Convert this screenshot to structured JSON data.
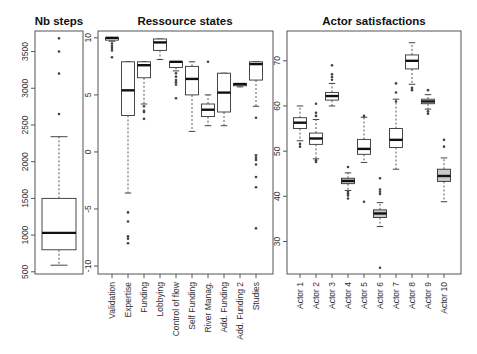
{
  "chart_data": [
    {
      "type": "box",
      "title": "Nb steps",
      "xlabel": "",
      "ylabel": "",
      "categories": [
        ""
      ],
      "yticks": [
        500,
        1000,
        1500,
        2000,
        2500,
        3000,
        3500
      ],
      "ylim": [
        470,
        3780
      ],
      "grid": false,
      "series": [
        {
          "name": "Nb steps",
          "whisker_low": 590,
          "q1": 800,
          "median": 1030,
          "q3": 1500,
          "whisker_high": 2340,
          "outliers": [
            2650,
            3200,
            3500,
            3680
          ],
          "fill": "#ffffff"
        }
      ]
    },
    {
      "type": "box",
      "title": "Ressource states",
      "xlabel": "",
      "ylabel": "",
      "categories": [
        "Validation",
        "Expertise",
        "Funding",
        "Lobbying",
        "Control of flow",
        "Self Funding",
        "River Manag.",
        "Add. Funding",
        "Add. Funding 2",
        "Studies"
      ],
      "yticks": [
        -10,
        -5,
        0,
        5,
        10
      ],
      "ylim": [
        -10.7,
        10.6
      ],
      "grid": false,
      "series": [
        {
          "name": "Validation",
          "whisker_low": 9.7,
          "q1": 9.8,
          "median": 10.0,
          "q3": 10.0,
          "whisker_high": 10.0,
          "outliers": [
            9.5,
            9.3,
            9.1,
            8.9,
            8.3
          ],
          "fill": "#ffffff"
        },
        {
          "name": "Expertise",
          "whisker_low": -3.6,
          "q1": 3.2,
          "median": 5.4,
          "q3": 7.9,
          "whisker_high": 7.9,
          "outliers": [
            -5.3,
            -6.1,
            -7.4,
            -7.6,
            -8.0
          ],
          "fill": "#ffffff"
        },
        {
          "name": "Funding",
          "whisker_low": 4.2,
          "q1": 6.5,
          "median": 7.6,
          "q3": 7.9,
          "whisker_high": 7.9,
          "outliers": [
            4.0,
            3.6,
            3.5,
            2.9
          ],
          "fill": "#ffffff"
        },
        {
          "name": "Lobbying",
          "whisker_low": 8.1,
          "q1": 8.9,
          "median": 9.6,
          "q3": 9.9,
          "whisker_high": 9.9,
          "outliers": [],
          "fill": "#ffffff"
        },
        {
          "name": "Control of flow",
          "whisker_low": 7.1,
          "q1": 7.4,
          "median": 7.9,
          "q3": 7.9,
          "whisker_high": 7.9,
          "outliers": [
            6.9,
            6.6,
            6.3,
            6.1,
            5.9,
            4.7
          ],
          "fill": "#ffffff"
        },
        {
          "name": "Self Funding",
          "whisker_low": 1.8,
          "q1": 5.0,
          "median": 6.4,
          "q3": 7.5,
          "whisker_high": 7.9,
          "outliers": [],
          "fill": "#ffffff"
        },
        {
          "name": "River Manag.",
          "whisker_low": 2.3,
          "q1": 3.1,
          "median": 3.7,
          "q3": 4.2,
          "whisker_high": 5.0,
          "outliers": [
            7.9
          ],
          "fill": "#ffffff"
        },
        {
          "name": "Add. Funding",
          "whisker_low": 2.3,
          "q1": 3.5,
          "median": 5.2,
          "q3": 6.9,
          "whisker_high": 6.9,
          "outliers": [],
          "fill": "#ffffff"
        },
        {
          "name": "Add. Funding 2",
          "whisker_low": 5.7,
          "q1": 5.8,
          "median": 5.95,
          "q3": 6.0,
          "whisker_high": 6.0,
          "outliers": [],
          "fill": "#ffffff"
        },
        {
          "name": "Studies",
          "whisker_low": 4.0,
          "q1": 6.3,
          "median": 7.7,
          "q3": 7.9,
          "whisker_high": 7.9,
          "outliers": [
            3.0,
            -0.3,
            -0.5,
            -0.7,
            -1.1,
            -2.2,
            -3.1,
            -6.7
          ],
          "fill": "#ffffff"
        }
      ]
    },
    {
      "type": "box",
      "title": "Actor satisfactions",
      "xlabel": "",
      "ylabel": "",
      "categories": [
        "Actor 1",
        "Actor 2",
        "Actor 3",
        "Actor 4",
        "Actor 5",
        "Actor 6",
        "Actor 7",
        "Actor 8",
        "Actor 9",
        "Actor 10"
      ],
      "yticks": [
        30,
        40,
        50,
        60,
        70
      ],
      "ylim": [
        22.8,
        76.6
      ],
      "grid": false,
      "series": [
        {
          "name": "Actor 1",
          "whisker_low": 52.3,
          "q1": 55.0,
          "median": 56.3,
          "q3": 57.4,
          "whisker_high": 60.0,
          "outliers": [
            51.6,
            51.0
          ],
          "fill": "#ffffff"
        },
        {
          "name": "Actor 2",
          "whisker_low": 48.3,
          "q1": 51.5,
          "median": 52.8,
          "q3": 54.0,
          "whisker_high": 57.0,
          "outliers": [
            60.5,
            58.5,
            57.8,
            48.0,
            47.6
          ],
          "fill": "#ffffff"
        },
        {
          "name": "Actor 3",
          "whisker_low": 60.0,
          "q1": 61.3,
          "median": 62.2,
          "q3": 63.0,
          "whisker_high": 65.0,
          "outliers": [
            69.0,
            67.0,
            66.4,
            65.8
          ],
          "fill": "#ffffff"
        },
        {
          "name": "Actor 4",
          "whisker_low": 41.3,
          "q1": 42.8,
          "median": 43.4,
          "q3": 44.0,
          "whisker_high": 45.2,
          "outliers": [
            46.5,
            41.0,
            40.6,
            40.2,
            39.5
          ],
          "fill": "#c8c8c8"
        },
        {
          "name": "Actor 5",
          "whisker_low": 47.5,
          "q1": 49.3,
          "median": 50.5,
          "q3": 52.6,
          "whisker_high": 57.5,
          "outliers": [
            57.8,
            38.8
          ],
          "fill": "#ffffff"
        },
        {
          "name": "Actor 6",
          "whisker_low": 33.3,
          "q1": 35.3,
          "median": 36.2,
          "q3": 37.0,
          "whisker_high": 38.6,
          "outliers": [
            44.0,
            41.5,
            41.0,
            40.5,
            24.2
          ],
          "fill": "#c8c8c8"
        },
        {
          "name": "Actor 7",
          "whisker_low": 46.0,
          "q1": 50.8,
          "median": 52.5,
          "q3": 55.0,
          "whisker_high": 61.5,
          "outliers": [
            65.0,
            63.0,
            61.0
          ],
          "fill": "#ffffff"
        },
        {
          "name": "Actor 8",
          "whisker_low": 64.8,
          "q1": 68.2,
          "median": 70.0,
          "q3": 71.3,
          "whisker_high": 74.0,
          "outliers": [
            64.0,
            63.5
          ],
          "fill": "#ffffff"
        },
        {
          "name": "Actor 9",
          "whisker_low": 59.3,
          "q1": 60.5,
          "median": 61.0,
          "q3": 61.5,
          "whisker_high": 62.5,
          "outliers": [
            63.5,
            58.8,
            58.3
          ],
          "fill": "#ffffff"
        },
        {
          "name": "Actor 10",
          "whisker_low": 38.8,
          "q1": 43.3,
          "median": 44.5,
          "q3": 46.0,
          "whisker_high": 48.5,
          "outliers": [
            52.5,
            51.0
          ],
          "fill": "#c8c8c8"
        }
      ]
    }
  ],
  "layout": {
    "panels": [
      {
        "left": 35,
        "top": 31,
        "right": 83,
        "bottom": 274,
        "box_half_width": 17,
        "category_x": [
          59
        ],
        "title_x": 59
      },
      {
        "left": 98,
        "top": 31,
        "right": 273,
        "bottom": 274,
        "box_half_width": 6.5,
        "category_x": [
          112,
          128,
          144,
          160,
          176,
          192,
          208,
          224,
          240,
          256
        ],
        "title_x": 185
      },
      {
        "left": 287,
        "top": 31,
        "right": 461,
        "bottom": 274,
        "box_half_width": 6.5,
        "category_x": [
          300,
          316,
          332,
          348,
          364,
          380,
          396,
          412,
          428,
          444
        ],
        "title_x": 374
      }
    ],
    "colors": {
      "frame": "#555555",
      "box_stroke": "#333333",
      "median": "#111111",
      "whisker": "#444444",
      "outlier": "#444444"
    }
  }
}
